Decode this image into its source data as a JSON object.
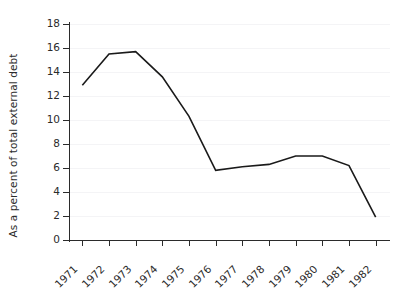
{
  "chart_data": {
    "type": "line",
    "title": "",
    "xlabel": "",
    "ylabel": "As a percent of total external debt",
    "categories": [
      "1971",
      "1972",
      "1973",
      "1974",
      "1975",
      "1976",
      "1977",
      "1978",
      "1979",
      "1980",
      "1981",
      "1982"
    ],
    "values": [
      12.9,
      15.5,
      15.7,
      13.6,
      10.3,
      5.8,
      6.1,
      6.3,
      7.0,
      7.0,
      6.2,
      1.9
    ],
    "series": [
      {
        "name": "As a percent of total external debt",
        "values": [
          12.9,
          15.5,
          15.7,
          13.6,
          10.3,
          5.8,
          6.1,
          6.3,
          7.0,
          7.0,
          6.2,
          1.9
        ]
      }
    ],
    "ylim": [
      0,
      18
    ],
    "ytick_labels": [
      "0",
      "2",
      "4",
      "6",
      "8",
      "10",
      "12",
      "14",
      "16",
      "18"
    ],
    "ytick_values": [
      0,
      2,
      4,
      6,
      8,
      10,
      12,
      14,
      16,
      18
    ],
    "xtick_labels": [
      "1971",
      "1972",
      "1973",
      "1974",
      "1975",
      "1976",
      "1977",
      "1978",
      "1979",
      "1980",
      "1981",
      "1982"
    ],
    "grid": true,
    "legend": "none",
    "line_color": "#1a1a1a",
    "axis_color": "#2b2b2b",
    "grid_color": "#f4f4f6",
    "background_color": "#ffffff",
    "xlabel_rotation": -45
  }
}
